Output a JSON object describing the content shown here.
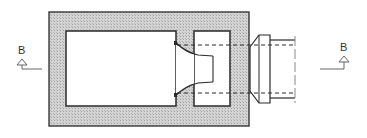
{
  "diagram": {
    "type": "mechanical-cross-section",
    "section_markers": [
      {
        "id": "left",
        "label": "B"
      },
      {
        "id": "right",
        "label": "B"
      }
    ],
    "colors": {
      "line": "#2a2a2a",
      "hatch_fill": "#cfcfcf",
      "hatch_dot": "#9a9a9a",
      "cavity": "#ffffff",
      "marker": "#555555"
    }
  }
}
